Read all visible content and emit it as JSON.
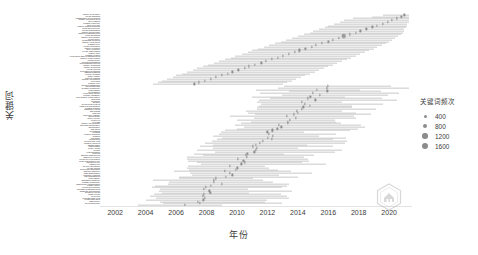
{
  "chart": {
    "type": "timeline",
    "y_axis_title": "关键词",
    "x_axis_title": "年份"
  },
  "legend": {
    "title": "关键词频次",
    "items": [
      {
        "label": "400",
        "size": 3.0
      },
      {
        "label": "800",
        "size": 4.2
      },
      {
        "label": "1200",
        "size": 5.4
      },
      {
        "label": "1600",
        "size": 6.6
      }
    ]
  },
  "watermark": {
    "name": "hexagon-logo-watermark"
  },
  "chart_data": {
    "type": "scatter",
    "title": "",
    "xlabel": "年份",
    "ylabel": "关键词",
    "xlim": [
      2001,
      2021.5
    ],
    "grid": false,
    "legend_position": "right",
    "legend_title": "关键词频次",
    "size_legend_values": [
      400,
      800,
      1200,
      1600
    ],
    "xticks": [
      2002,
      2004,
      2006,
      2008,
      2010,
      2012,
      2014,
      2016,
      2018,
      2020
    ],
    "categories": [
      "marine heat wave",
      "ocean warming",
      "sustainable development",
      "marine protected area",
      "blue carbon",
      "coastal resilience",
      "sea level rise",
      "marine spatial planning",
      "ecosystem service",
      "ocean acidification",
      "marine biodiversity",
      "fisheries management",
      "coral bleaching",
      "marine governance",
      "ocean policy",
      "seagrass meadow",
      "marine ecosystem",
      "coastal zone",
      "ocean circulation",
      "marine pollution",
      "blue economy",
      "ocean observation",
      "marine litter",
      "coastal erosion",
      "ecosystem based management",
      "marine conservation",
      "ocean model",
      "sediment transport",
      "phytoplankton bloom",
      "estuary dynamics",
      "marine sediment",
      "ocean current",
      "population dynamics",
      "habitat mapping",
      "remote sensing",
      "water quality",
      "nutrient loading",
      "primary production",
      "food web",
      "trophic level",
      "species distribution",
      "larval dispersal",
      "benthic community",
      "macroalgae",
      "zooplankton",
      "ecosystem model",
      "climate variability",
      "sea surface temperature",
      "upwelling",
      "monsoon",
      "El Nino",
      "ocean heat content",
      "carbon sequestration",
      "coastal wetland",
      "mangrove forest",
      "salt marsh",
      "tidal flat",
      "shoreline change",
      "storm surge",
      "wave energy",
      "coral reef",
      "reef fish",
      "marine invertebrate",
      "shellfish aquaculture",
      "aquaculture",
      "fish stock",
      "overfishing",
      "bycatch",
      "marine mammal",
      "seabird",
      "sea turtle",
      "megafauna",
      "biodiversity loss",
      "invasive species",
      "ballast water",
      "microplastic",
      "heavy metal",
      "oil spill",
      "eutrophication",
      "hypoxia",
      "harmful algal bloom",
      "dissolved oxygen",
      "ocean deoxygenation",
      "biogeochemical cycle",
      "nitrogen cycle",
      "carbon flux",
      "air sea interaction",
      "ocean mixing",
      "numerical simulation",
      "satellite altimetry",
      "data assimilation",
      "machine learning",
      "risk assessment",
      "vulnerability",
      "adaptation strategy",
      "coastal community",
      "stakeholder participation",
      "marine policy",
      "ocean governance",
      "integrated management",
      "antarctic circumpolar",
      "southern ocean",
      "arctic ocean",
      "deep sea",
      "hydrothermal vent",
      "continental shelf",
      "bathymetry",
      "geomorphology"
    ],
    "points": [
      {
        "keyword": "marine heat wave",
        "year": 2021.0,
        "freq": 520,
        "span": [
          2019.6,
          2021.3
        ]
      },
      {
        "keyword": "ocean warming",
        "year": 2020.8,
        "freq": 470,
        "span": [
          2018.9,
          2021.3
        ]
      },
      {
        "keyword": "sustainable development",
        "year": 2020.5,
        "freq": 430,
        "span": [
          2017.6,
          2021.3
        ]
      },
      {
        "keyword": "marine protected area",
        "year": 2020.2,
        "freq": 410,
        "span": [
          2017.0,
          2021.3
        ]
      },
      {
        "keyword": "blue carbon",
        "year": 2019.9,
        "freq": 400,
        "span": [
          2016.8,
          2021.3
        ]
      },
      {
        "keyword": "coastal resilience",
        "year": 2019.6,
        "freq": 400,
        "span": [
          2016.4,
          2021.2
        ]
      },
      {
        "keyword": "sea level rise",
        "year": 2019.2,
        "freq": 430,
        "span": [
          2016.0,
          2021.2
        ]
      },
      {
        "keyword": "marine spatial planning",
        "year": 2018.9,
        "freq": 420,
        "span": [
          2015.8,
          2021.1
        ]
      },
      {
        "keyword": "ecosystem service",
        "year": 2018.5,
        "freq": 450,
        "span": [
          2015.4,
          2021.0
        ]
      },
      {
        "keyword": "ocean acidification",
        "year": 2018.1,
        "freq": 430,
        "span": [
          2015.0,
          2021.0
        ]
      },
      {
        "keyword": "marine biodiversity",
        "year": 2017.8,
        "freq": 410,
        "span": [
          2014.8,
          2020.9
        ]
      },
      {
        "keyword": "fisheries management",
        "year": 2017.4,
        "freq": 400,
        "span": [
          2014.4,
          2020.8
        ]
      },
      {
        "keyword": "coral bleaching",
        "year": 2017.0,
        "freq": 1500,
        "span": [
          2014.0,
          2020.6
        ]
      },
      {
        "keyword": "marine governance",
        "year": 2016.7,
        "freq": 520,
        "span": [
          2013.6,
          2020.4
        ]
      },
      {
        "keyword": "ocean policy",
        "year": 2016.3,
        "freq": 470,
        "span": [
          2013.2,
          2020.2
        ]
      },
      {
        "keyword": "seagrass meadow",
        "year": 2016.0,
        "freq": 430,
        "span": [
          2012.9,
          2020.0
        ]
      },
      {
        "keyword": "marine ecosystem",
        "year": 2015.6,
        "freq": 480,
        "span": [
          2012.5,
          2019.8
        ]
      },
      {
        "keyword": "coastal zone",
        "year": 2015.2,
        "freq": 440,
        "span": [
          2012.1,
          2019.5
        ]
      },
      {
        "keyword": "ocean circulation",
        "year": 2014.9,
        "freq": 420,
        "span": [
          2011.8,
          2019.2
        ]
      },
      {
        "keyword": "marine pollution",
        "year": 2014.5,
        "freq": 450,
        "span": [
          2011.4,
          2019.0
        ]
      },
      {
        "keyword": "blue economy",
        "year": 2014.1,
        "freq": 420,
        "span": [
          2011.0,
          2018.7
        ]
      },
      {
        "keyword": "ocean observation",
        "year": 2013.8,
        "freq": 410,
        "span": [
          2010.7,
          2018.4
        ]
      },
      {
        "keyword": "marine litter",
        "year": 2013.4,
        "freq": 430,
        "span": [
          2010.3,
          2018.1
        ]
      },
      {
        "keyword": "coastal erosion",
        "year": 2013.0,
        "freq": 420,
        "span": [
          2009.9,
          2017.8
        ]
      },
      {
        "keyword": "ecosystem based management",
        "year": 2012.7,
        "freq": 460,
        "span": [
          2009.6,
          2017.5
        ]
      },
      {
        "keyword": "marine conservation",
        "year": 2012.3,
        "freq": 440,
        "span": [
          2009.2,
          2017.2
        ]
      },
      {
        "keyword": "ocean model",
        "year": 2011.9,
        "freq": 410,
        "span": [
          2008.8,
          2016.9
        ]
      },
      {
        "keyword": "sediment transport",
        "year": 2011.6,
        "freq": 400,
        "span": [
          2008.5,
          2016.6
        ]
      },
      {
        "keyword": "phytoplankton bloom",
        "year": 2011.2,
        "freq": 420,
        "span": [
          2008.1,
          2016.3
        ]
      },
      {
        "keyword": "estuary dynamics",
        "year": 2010.8,
        "freq": 410,
        "span": [
          2007.8,
          2016.0
        ]
      },
      {
        "keyword": "marine sediment",
        "year": 2010.5,
        "freq": 400,
        "span": [
          2007.4,
          2015.7
        ]
      },
      {
        "keyword": "ocean current",
        "year": 2010.1,
        "freq": 430,
        "span": [
          2007.1,
          2015.4
        ]
      },
      {
        "keyword": "population dynamics",
        "year": 2009.7,
        "freq": 450,
        "span": [
          2006.7,
          2015.1
        ]
      },
      {
        "keyword": "habitat mapping",
        "year": 2009.4,
        "freq": 410,
        "span": [
          2006.4,
          2014.8
        ]
      },
      {
        "keyword": "remote sensing",
        "year": 2009.0,
        "freq": 470,
        "span": [
          2006.0,
          2014.5
        ]
      },
      {
        "keyword": "water quality",
        "year": 2008.6,
        "freq": 440,
        "span": [
          2005.8,
          2014.2
        ]
      },
      {
        "keyword": "nutrient loading",
        "year": 2008.3,
        "freq": 410,
        "span": [
          2005.4,
          2013.9
        ]
      },
      {
        "keyword": "primary production",
        "year": 2007.9,
        "freq": 430,
        "span": [
          2005.1,
          2013.6
        ]
      },
      {
        "keyword": "food web",
        "year": 2007.5,
        "freq": 420,
        "span": [
          2004.8,
          2013.3
        ]
      },
      {
        "keyword": "trophic level",
        "year": 2007.2,
        "freq": 400,
        "span": [
          2004.5,
          2013.0
        ]
      }
    ]
  },
  "y_labels": [
    "marine heat wave",
    "ocean warming",
    "sustainable development",
    "marine protected area",
    "blue carbon",
    "coastal resilience",
    "sea level rise",
    "marine spatial planning",
    "ecosystem service",
    "ocean acidification",
    "marine biodiversity",
    "fisheries management",
    "coral bleaching",
    "marine governance",
    "ocean policy",
    "seagrass meadow",
    "marine ecosystem",
    "coastal zone",
    "ocean circulation",
    "marine pollution",
    "blue economy",
    "ocean observation",
    "marine litter",
    "coastal erosion",
    "ecosystem based management",
    "marine conservation",
    "ocean model",
    "sediment transport",
    "phytoplankton bloom",
    "estuary dynamics",
    "marine sediment",
    "ocean current",
    "population dynamics",
    "habitat mapping",
    "remote sensing",
    "water quality",
    "nutrient loading",
    "primary production",
    "food web",
    "trophic level",
    "species distribution",
    "larval dispersal",
    "benthic community",
    "macroalgae",
    "zooplankton",
    "ecosystem model",
    "climate variability",
    "sea surface temperature",
    "upwelling",
    "monsoon",
    "El Nino",
    "ocean heat content",
    "carbon sequestration",
    "coastal wetland",
    "mangrove forest",
    "salt marsh",
    "tidal flat",
    "shoreline change",
    "storm surge",
    "wave energy",
    "coral reef",
    "reef fish",
    "marine invertebrate",
    "shellfish aquaculture",
    "aquaculture",
    "fish stock",
    "overfishing",
    "bycatch",
    "marine mammal",
    "seabird",
    "sea turtle",
    "megafauna",
    "biodiversity loss",
    "invasive species",
    "ballast water",
    "microplastic",
    "heavy metal",
    "oil spill",
    "eutrophication",
    "hypoxia",
    "harmful algal bloom",
    "dissolved oxygen",
    "ocean deoxygenation",
    "biogeochemical cycle",
    "nitrogen cycle",
    "carbon flux",
    "air sea interaction",
    "ocean mixing",
    "numerical simulation",
    "satellite altimetry",
    "data assimilation",
    "machine learning",
    "risk assessment",
    "vulnerability",
    "adaptation strategy",
    "coastal community",
    "stakeholder participation",
    "marine policy",
    "ocean governance",
    "integrated management",
    "antarctic circumpolar",
    "southern ocean",
    "arctic ocean",
    "deep sea",
    "hydrothermal vent",
    "continental shelf",
    "bathymetry",
    "geomorphology"
  ]
}
